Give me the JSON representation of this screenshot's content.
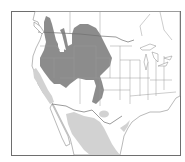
{
  "map": {
    "type": "species-range-map",
    "region": "Western North America",
    "legend": [],
    "colors": {
      "primary_range": "#8c8c8c",
      "secondary_range": "#d2d2d2",
      "land": "#ffffff",
      "frame": "#6e6e6e",
      "borders": "#9a9a9a"
    },
    "ranges": [
      {
        "id": "primary",
        "label": "",
        "color": "#8c8c8c"
      },
      {
        "id": "secondary",
        "label": "",
        "color": "#d2d2d2"
      }
    ]
  }
}
